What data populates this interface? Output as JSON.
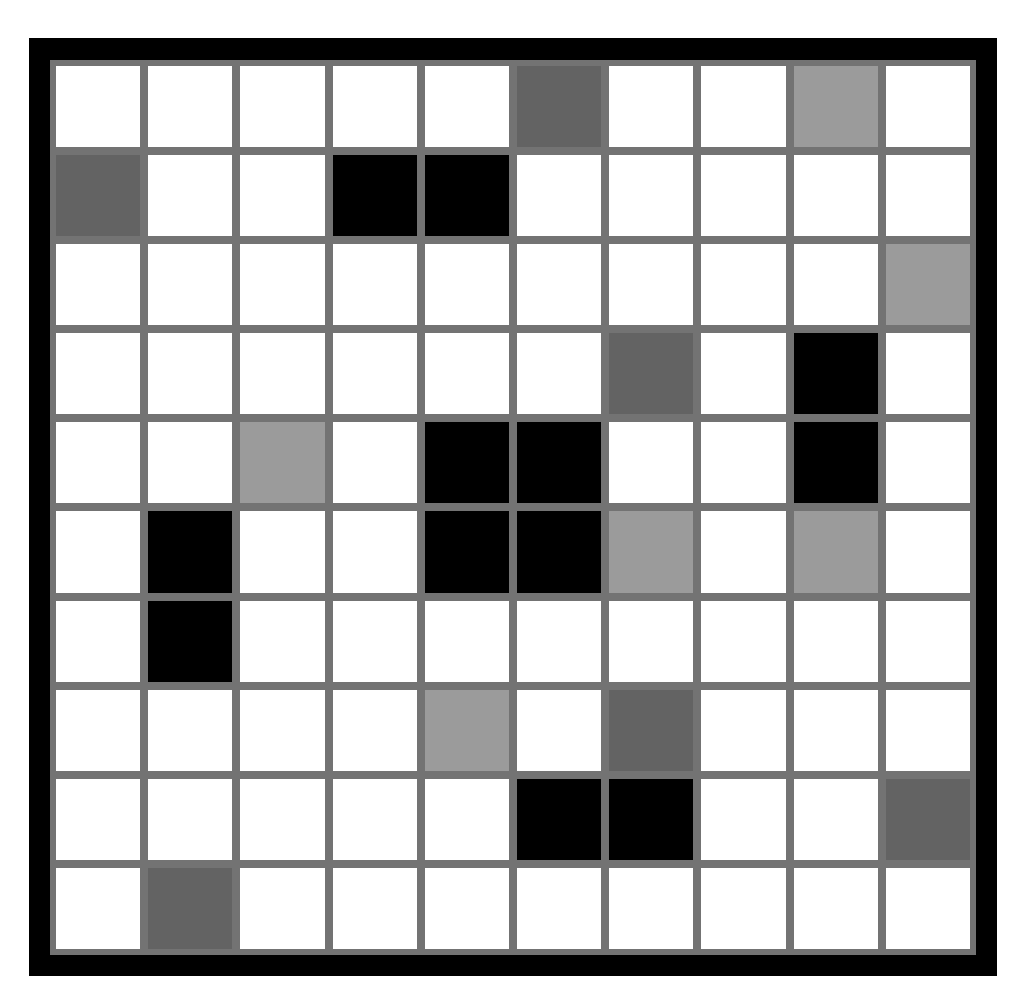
{
  "board": {
    "rows": 10,
    "cols": 10,
    "legend": {
      "W": "empty",
      "D": "dark-gray",
      "L": "light-gray",
      "B": "black"
    },
    "colors": {
      "W": "#ffffff",
      "D": "#636363",
      "L": "#9b9b9b",
      "B": "#000000",
      "gridline": "#737373",
      "frame": "#000000"
    },
    "cells": [
      [
        "W",
        "W",
        "W",
        "W",
        "W",
        "D",
        "W",
        "W",
        "L",
        "W"
      ],
      [
        "D",
        "W",
        "W",
        "B",
        "B",
        "W",
        "W",
        "W",
        "W",
        "W"
      ],
      [
        "W",
        "W",
        "W",
        "W",
        "W",
        "W",
        "W",
        "W",
        "W",
        "L"
      ],
      [
        "W",
        "W",
        "W",
        "W",
        "W",
        "W",
        "D",
        "W",
        "B",
        "W"
      ],
      [
        "W",
        "W",
        "L",
        "W",
        "B",
        "B",
        "W",
        "W",
        "B",
        "W"
      ],
      [
        "W",
        "B",
        "W",
        "W",
        "B",
        "B",
        "L",
        "W",
        "L",
        "W"
      ],
      [
        "W",
        "B",
        "W",
        "W",
        "W",
        "W",
        "W",
        "W",
        "W",
        "W"
      ],
      [
        "W",
        "W",
        "W",
        "W",
        "L",
        "W",
        "D",
        "W",
        "W",
        "W"
      ],
      [
        "W",
        "W",
        "W",
        "W",
        "W",
        "B",
        "B",
        "W",
        "W",
        "D"
      ],
      [
        "W",
        "D",
        "W",
        "W",
        "W",
        "W",
        "W",
        "W",
        "W",
        "W"
      ]
    ]
  }
}
